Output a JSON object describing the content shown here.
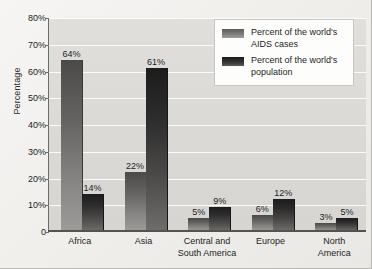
{
  "chart_data": {
    "type": "bar",
    "title": "",
    "xlabel": "",
    "ylabel": "Percentage",
    "ylim": [
      0,
      80
    ],
    "grid": true,
    "legend_position": "top-right",
    "categories": [
      "Africa",
      "Asia",
      "Central and\nSouth America",
      "Europe",
      "North\nAmerica"
    ],
    "ytick_labels": [
      "0",
      "10%",
      "20%",
      "30%",
      "40%",
      "50%",
      "60%",
      "70%",
      "80%"
    ],
    "ytick_values": [
      0,
      10,
      20,
      30,
      40,
      50,
      60,
      70,
      80
    ],
    "series": [
      {
        "name": "Percent of the world's AIDS cases",
        "values": [
          64,
          22,
          5,
          6,
          3
        ],
        "labels": [
          "64%",
          "22%",
          "5%",
          "6%",
          "3%"
        ],
        "color": "#7d7c7a"
      },
      {
        "name": "Percent of the world's population",
        "values": [
          14,
          61,
          9,
          12,
          5
        ],
        "labels": [
          "14%",
          "61%",
          "9%",
          "12%",
          "5%"
        ],
        "color": "#343333"
      }
    ]
  },
  "legend": {
    "items": [
      {
        "label": "Percent of the world's AIDS cases"
      },
      {
        "label": "Percent of the world's population"
      }
    ]
  },
  "axis": {
    "y_title": "Percentage"
  }
}
